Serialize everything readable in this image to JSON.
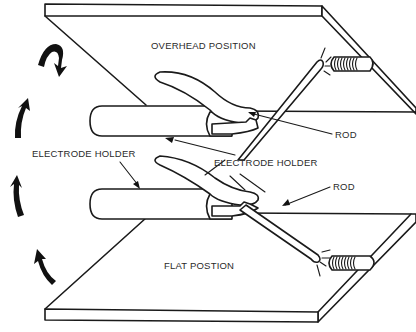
{
  "figure": {
    "type": "line-drawing",
    "colors": {
      "line": "#1a1a1a",
      "background": "#ffffff"
    }
  },
  "labels": {
    "overhead_position": "OVERHEAD POSITION",
    "flat_position": "FLAT POSTION",
    "electrode_holder_left": "ELECTRODE HOLDER",
    "electrode_holder_center": "ELECTRODE HOLDER",
    "rod_top": "ROD",
    "rod_bottom": "ROD"
  },
  "elements": {
    "plates": [
      "overhead-plate",
      "flat-plate"
    ],
    "holders": [
      "upper-electrode-holder",
      "lower-electrode-holder"
    ],
    "rods": [
      "upper-rod",
      "lower-rod"
    ],
    "weld_beads": [
      "overhead-weld-bead",
      "flat-weld-bead"
    ],
    "rotation_arrows": 4
  }
}
